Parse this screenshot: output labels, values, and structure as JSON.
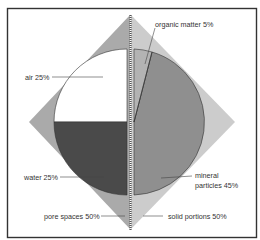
{
  "diagram": {
    "type": "soil composition pie diagram",
    "labels": {
      "organic": "organic matter 5%",
      "air": "air 25%",
      "water": "water 25%",
      "mineral_line1": "mineral",
      "mineral_line2": "particles 45%",
      "pore": "pore spaces 50%",
      "solid": "solid portions 50%"
    },
    "segments": [
      {
        "name": "organic matter",
        "percent": 5,
        "color": "#b3b3b3"
      },
      {
        "name": "mineral particles",
        "percent": 45,
        "color": "#8f8f8f"
      },
      {
        "name": "water",
        "percent": 25,
        "color": "#4a4a4a"
      },
      {
        "name": "air",
        "percent": 25,
        "color": "#ffffff"
      }
    ],
    "groups": [
      {
        "name": "pore spaces",
        "percent": 50
      },
      {
        "name": "solid portions",
        "percent": 50
      }
    ],
    "colors": {
      "diamond_left": "#aaaaaa",
      "diamond_right": "#cccccc",
      "frame": "#333333"
    }
  }
}
